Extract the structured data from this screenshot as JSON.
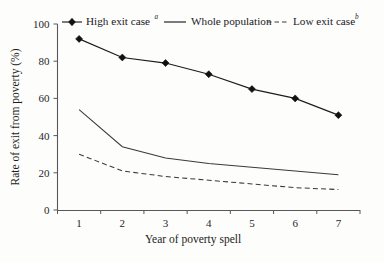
{
  "chart_data": {
    "type": "line",
    "title": "",
    "xlabel": "Year of poverty spell",
    "ylabel": "Rate of exit from poverty (%)",
    "x": [
      1,
      2,
      3,
      4,
      5,
      6,
      7
    ],
    "xtick_labels": [
      "1",
      "2",
      "3",
      "4",
      "5",
      "6",
      "7"
    ],
    "ytick_labels": [
      "0",
      "20",
      "40",
      "60",
      "80",
      "100"
    ],
    "ytick_values": [
      0,
      20,
      40,
      60,
      80,
      100
    ],
    "xlim": [
      0.5,
      7.5
    ],
    "ylim": [
      0,
      100
    ],
    "grid": false,
    "legend_position": "top",
    "series": [
      {
        "name": "High exit case",
        "name_superscript": "a",
        "style": "solid-with-diamond-markers",
        "marker": "diamond",
        "color": "#1d1d1d",
        "values": [
          92,
          82,
          79,
          73,
          65,
          60,
          51
        ]
      },
      {
        "name": "Whole population",
        "name_superscript": "",
        "style": "solid",
        "marker": "none",
        "color": "#3a3a3c",
        "values": [
          54,
          34,
          28,
          25,
          23,
          21,
          19
        ]
      },
      {
        "name": "Low exit case",
        "name_superscript": "b",
        "style": "dashed",
        "marker": "none",
        "color": "#3a3a3c",
        "values": [
          30,
          21,
          18,
          16,
          14,
          12,
          11
        ]
      }
    ]
  },
  "legend": {
    "items": [
      {
        "label": "High exit case",
        "superscript": "a"
      },
      {
        "label": "Whole population",
        "superscript": ""
      },
      {
        "label": "Low exit case",
        "superscript": "b"
      }
    ]
  },
  "axes": {
    "y_title": "Rate of exit from poverty (%)",
    "x_title": "Year of poverty spell"
  }
}
